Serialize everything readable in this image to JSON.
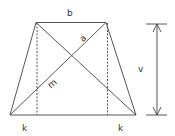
{
  "diagram": {
    "colors": {
      "line": "#444444",
      "background": "#ffffff"
    },
    "labels": {
      "top_base": "b",
      "diagonal_upper": "a",
      "diagonal_lower": "m",
      "height": "v",
      "left_offset": "k",
      "right_offset": "k"
    }
  }
}
